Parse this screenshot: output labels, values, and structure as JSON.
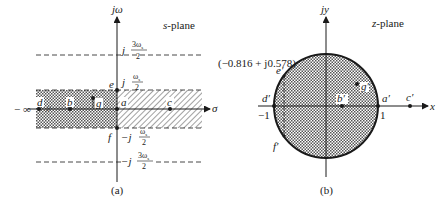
{
  "panel_a": {
    "plane_title_var": "s",
    "plane_title_rest": "-plane",
    "vertical_axis_label": "jω",
    "horizontal_axis_label": "σ",
    "neg_infinity_label": "− ∞",
    "caption": "(a)",
    "frequency_labels": {
      "pos_3ws_half": {
        "j": "j",
        "num": "3ω",
        "sub": "s",
        "den": "2"
      },
      "pos_ws_half": {
        "j": "j",
        "num": "ω",
        "sub": "s",
        "den": "2"
      },
      "neg_ws_half": {
        "j": "−j",
        "num": "ω",
        "sub": "s",
        "den": "2"
      },
      "neg_3ws_half": {
        "j": "−j",
        "num": "3ω",
        "sub": "s",
        "den": "2"
      }
    },
    "points": [
      {
        "name": "a",
        "label": "a"
      },
      {
        "name": "b",
        "label": "b"
      },
      {
        "name": "c",
        "label": "c"
      },
      {
        "name": "d",
        "label": "d"
      },
      {
        "name": "e",
        "label": "e"
      },
      {
        "name": "f",
        "label": "f"
      },
      {
        "name": "g",
        "label": "g"
      }
    ],
    "break_mark": "//"
  },
  "panel_b": {
    "plane_title_var": "z",
    "plane_title_rest": "-plane",
    "vertical_axis_label": "jy",
    "horizontal_axis_label": "x",
    "caption": "(b)",
    "unit_circle_radius": 1,
    "tick_labels": {
      "neg_one": "−1",
      "pos_one": "1"
    },
    "annotation_e_prime": "(−0.816 + j0.578)",
    "points": [
      {
        "name": "a-prime",
        "label": "a′"
      },
      {
        "name": "b-prime",
        "label": "b′"
      },
      {
        "name": "c-prime",
        "label": "c′"
      },
      {
        "name": "d-prime",
        "label": "d′"
      },
      {
        "name": "e-prime",
        "label": "e′"
      },
      {
        "name": "f-prime",
        "label": "f′"
      },
      {
        "name": "g-prime",
        "label": "g′"
      }
    ]
  },
  "colors": {
    "ink": "#1a1a1a",
    "background": "#ffffff"
  }
}
